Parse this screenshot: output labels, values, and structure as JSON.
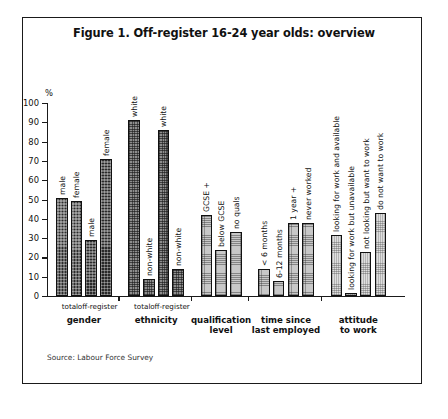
{
  "figure": {
    "title": "Figure 1. Off-register 16-24 year olds: overview",
    "source": "Source: Labour Force Survey"
  },
  "axis": {
    "y_unit": "%",
    "y_ticks": [
      "0",
      "10",
      "20",
      "30",
      "40",
      "50",
      "60",
      "70",
      "80",
      "90",
      "100"
    ]
  },
  "groups": [
    {
      "name": "gender",
      "label": "gender",
      "sublabels": [
        "total",
        "off-register"
      ],
      "bars": [
        {
          "label": "male",
          "value": 51
        },
        {
          "label": "female",
          "value": 49
        },
        {
          "label": "male",
          "value": 29
        },
        {
          "label": "female",
          "value": 71
        }
      ]
    },
    {
      "name": "ethnicity",
      "label": "ethnicity",
      "sublabels": [
        "total",
        "off-register"
      ],
      "bars": [
        {
          "label": "white",
          "value": 91
        },
        {
          "label": "non-white",
          "value": 9
        },
        {
          "label": "white",
          "value": 86
        },
        {
          "label": "non-white",
          "value": 14
        }
      ]
    },
    {
      "name": "qualification-level",
      "label": "qualification\nlevel",
      "sublabels": [],
      "bars": [
        {
          "label": "GCSE +",
          "value": 42
        },
        {
          "label": "below GCSE",
          "value": 24
        },
        {
          "label": "no quals",
          "value": 33
        }
      ]
    },
    {
      "name": "time-since-last-employed",
      "label": "time since\nlast employed",
      "sublabels": [],
      "bars": [
        {
          "label": "< 6 months",
          "value": 14
        },
        {
          "label": "6-12 months",
          "value": 8
        },
        {
          "label": "1 year +",
          "value": 38
        },
        {
          "label": "never worked",
          "value": 38
        }
      ]
    },
    {
      "name": "attitude-to-work",
      "label": "attitude\nto work",
      "sublabels": [],
      "bars": [
        {
          "label": "looking for work and available",
          "value": 31.5
        },
        {
          "label": "looking for work but unavailable",
          "value": 1.5
        },
        {
          "label": "not looking but want to work",
          "value": 23
        },
        {
          "label": "do not want to work",
          "value": 43
        }
      ]
    }
  ],
  "chart_data": {
    "type": "bar",
    "title": "Figure 1. Off-register 16-24 year olds: overview",
    "xlabel": "",
    "ylabel": "%",
    "ylim": [
      0,
      100
    ],
    "grid": false,
    "legend": "none",
    "categories": [
      "gender/total: male",
      "gender/total: female",
      "gender/off-register: male",
      "gender/off-register: female",
      "ethnicity/total: white",
      "ethnicity/total: non-white",
      "ethnicity/off-register: white",
      "ethnicity/off-register: non-white",
      "qualification level: GCSE +",
      "qualification level: below GCSE",
      "qualification level: no quals",
      "time since last employed: < 6 months",
      "time since last employed: 6-12 months",
      "time since last employed: 1 year +",
      "time since last employed: never worked",
      "attitude to work: looking for work and available",
      "attitude to work: looking for work but unavailable",
      "attitude to work: not looking but want to work",
      "attitude to work: do not want to work"
    ],
    "values": [
      51,
      49,
      29,
      71,
      91,
      9,
      86,
      14,
      42,
      24,
      33,
      14,
      8,
      38,
      38,
      31.5,
      1.5,
      23,
      43
    ],
    "annotations": [
      "Source: Labour Force Survey"
    ]
  }
}
